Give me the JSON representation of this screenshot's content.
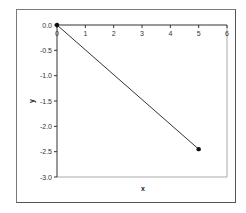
{
  "chart_data": {
    "type": "line",
    "title": "",
    "xlabel": "x",
    "ylabel": "y",
    "xlim": [
      0,
      6
    ],
    "ylim": [
      -3.0,
      0.0
    ],
    "x_ticks": [
      "0",
      "1",
      "2",
      "3",
      "4",
      "5",
      "6"
    ],
    "y_ticks": [
      "0.0",
      "-0.5",
      "-1.0",
      "-1.5",
      "-2.0",
      "-2.5",
      "-3.0"
    ],
    "grid": false,
    "legend": null,
    "series": [
      {
        "name": "series-1",
        "x": [
          0,
          5
        ],
        "y": [
          0.0,
          -2.45
        ],
        "color": "#333333",
        "marker": "circle"
      }
    ]
  },
  "labels": {
    "x_axis": "x",
    "y_axis": "y"
  }
}
